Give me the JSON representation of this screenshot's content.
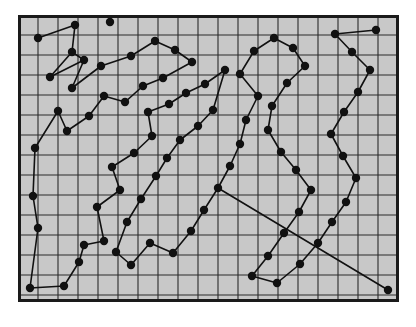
{
  "figure": {
    "title": "",
    "background_color": "#ffffff",
    "panel_fill": "#c8c8c8",
    "panel_border_color": "#1a1a1a",
    "grid_color": "#2b2b2b",
    "node_color": "#111111",
    "edge_color": "#111111",
    "panel": {
      "x": 18,
      "y": 15,
      "width": 381,
      "height": 287
    },
    "grid": {
      "cell_size": 20,
      "columns": 19,
      "rows": 14,
      "visible": true
    },
    "node_radius": 4.2,
    "edge_width": 1.6,
    "panel_border_width": 3
  },
  "chart_data": {
    "type": "scatter",
    "title": "",
    "xlabel": "",
    "ylabel": "",
    "xlim": [
      18,
      399
    ],
    "ylim": [
      15,
      302
    ],
    "grid": true,
    "legend": null,
    "tick_labels": {
      "x": [],
      "y": []
    },
    "annotations": [],
    "node_count": 85,
    "edge_count": 84,
    "nodes": [
      [
        38,
        38
      ],
      [
        75,
        25
      ],
      [
        72,
        52
      ],
      [
        50,
        77
      ],
      [
        110,
        22
      ],
      [
        84,
        60
      ],
      [
        72,
        88
      ],
      [
        101,
        66
      ],
      [
        131,
        56
      ],
      [
        155,
        41
      ],
      [
        175,
        50
      ],
      [
        192,
        62
      ],
      [
        163,
        78
      ],
      [
        143,
        86
      ],
      [
        125,
        102
      ],
      [
        104,
        96
      ],
      [
        89,
        116
      ],
      [
        67,
        131
      ],
      [
        58,
        111
      ],
      [
        35,
        148
      ],
      [
        33,
        196
      ],
      [
        38,
        228
      ],
      [
        30,
        288
      ],
      [
        64,
        286
      ],
      [
        79,
        262
      ],
      [
        84,
        245
      ],
      [
        104,
        241
      ],
      [
        97,
        207
      ],
      [
        120,
        190
      ],
      [
        112,
        167
      ],
      [
        134,
        153
      ],
      [
        152,
        136
      ],
      [
        148,
        112
      ],
      [
        169,
        104
      ],
      [
        186,
        93
      ],
      [
        205,
        84
      ],
      [
        225,
        70
      ],
      [
        213,
        110
      ],
      [
        198,
        126
      ],
      [
        180,
        140
      ],
      [
        167,
        158
      ],
      [
        156,
        176
      ],
      [
        141,
        199
      ],
      [
        127,
        222
      ],
      [
        116,
        252
      ],
      [
        131,
        265
      ],
      [
        150,
        243
      ],
      [
        173,
        253
      ],
      [
        191,
        231
      ],
      [
        204,
        210
      ],
      [
        218,
        188
      ],
      [
        230,
        166
      ],
      [
        240,
        144
      ],
      [
        246,
        120
      ],
      [
        258,
        96
      ],
      [
        240,
        74
      ],
      [
        254,
        51
      ],
      [
        274,
        38
      ],
      [
        293,
        48
      ],
      [
        305,
        66
      ],
      [
        287,
        83
      ],
      [
        272,
        106
      ],
      [
        268,
        130
      ],
      [
        281,
        152
      ],
      [
        296,
        170
      ],
      [
        311,
        190
      ],
      [
        299,
        212
      ],
      [
        284,
        233
      ],
      [
        268,
        256
      ],
      [
        252,
        276
      ],
      [
        277,
        283
      ],
      [
        300,
        264
      ],
      [
        318,
        243
      ],
      [
        332,
        222
      ],
      [
        346,
        202
      ],
      [
        356,
        178
      ],
      [
        343,
        156
      ],
      [
        331,
        134
      ],
      [
        344,
        112
      ],
      [
        358,
        92
      ],
      [
        370,
        70
      ],
      [
        352,
        52
      ],
      [
        335,
        34
      ],
      [
        376,
        30
      ],
      [
        388,
        290
      ]
    ],
    "edges": [
      [
        0,
        1
      ],
      [
        1,
        2
      ],
      [
        2,
        3
      ],
      [
        3,
        5
      ],
      [
        5,
        2
      ],
      [
        5,
        6
      ],
      [
        6,
        7
      ],
      [
        7,
        8
      ],
      [
        8,
        9
      ],
      [
        9,
        10
      ],
      [
        10,
        11
      ],
      [
        11,
        12
      ],
      [
        12,
        13
      ],
      [
        13,
        14
      ],
      [
        14,
        15
      ],
      [
        15,
        16
      ],
      [
        16,
        17
      ],
      [
        17,
        18
      ],
      [
        18,
        19
      ],
      [
        19,
        20
      ],
      [
        20,
        21
      ],
      [
        21,
        22
      ],
      [
        22,
        23
      ],
      [
        23,
        24
      ],
      [
        24,
        25
      ],
      [
        25,
        26
      ],
      [
        26,
        27
      ],
      [
        27,
        28
      ],
      [
        28,
        29
      ],
      [
        29,
        30
      ],
      [
        30,
        31
      ],
      [
        31,
        32
      ],
      [
        32,
        33
      ],
      [
        33,
        34
      ],
      [
        34,
        35
      ],
      [
        35,
        36
      ],
      [
        36,
        37
      ],
      [
        37,
        38
      ],
      [
        38,
        39
      ],
      [
        39,
        40
      ],
      [
        40,
        41
      ],
      [
        41,
        42
      ],
      [
        42,
        43
      ],
      [
        43,
        44
      ],
      [
        44,
        45
      ],
      [
        45,
        46
      ],
      [
        46,
        47
      ],
      [
        47,
        48
      ],
      [
        48,
        49
      ],
      [
        49,
        50
      ],
      [
        50,
        51
      ],
      [
        51,
        52
      ],
      [
        52,
        53
      ],
      [
        53,
        54
      ],
      [
        54,
        55
      ],
      [
        55,
        56
      ],
      [
        56,
        57
      ],
      [
        57,
        58
      ],
      [
        58,
        59
      ],
      [
        59,
        60
      ],
      [
        60,
        61
      ],
      [
        61,
        62
      ],
      [
        62,
        63
      ],
      [
        63,
        64
      ],
      [
        64,
        65
      ],
      [
        65,
        66
      ],
      [
        66,
        67
      ],
      [
        67,
        68
      ],
      [
        68,
        69
      ],
      [
        69,
        70
      ],
      [
        70,
        71
      ],
      [
        71,
        72
      ],
      [
        72,
        73
      ],
      [
        73,
        74
      ],
      [
        74,
        75
      ],
      [
        75,
        76
      ],
      [
        76,
        77
      ],
      [
        77,
        78
      ],
      [
        78,
        79
      ],
      [
        79,
        80
      ],
      [
        80,
        81
      ],
      [
        81,
        82
      ],
      [
        82,
        83
      ],
      [
        50,
        84
      ]
    ]
  }
}
